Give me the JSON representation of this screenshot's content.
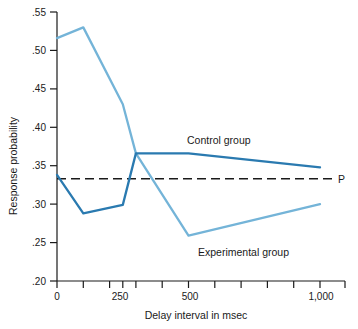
{
  "chart_data": {
    "type": "line",
    "title": "",
    "xlabel": "Delay interval in msec",
    "ylabel": "Response probability",
    "xlim": [
      0,
      1100
    ],
    "ylim": [
      0.2,
      0.55
    ],
    "grid": false,
    "legend_position": "inline-annotation",
    "x_ticks": [
      0,
      100,
      200,
      250,
      300,
      400,
      500,
      600,
      700,
      800,
      900,
      1000,
      1100
    ],
    "x_tick_labels": [
      "0",
      "",
      "",
      "250",
      "",
      "",
      "500",
      "",
      "",
      "",
      "",
      "1,000",
      ""
    ],
    "y_ticks": [
      0.2,
      0.25,
      0.3,
      0.35,
      0.4,
      0.45,
      0.5,
      0.55
    ],
    "y_tick_labels": [
      ".20",
      ".25",
      ".30",
      ".35",
      ".40",
      ".45",
      ".50",
      ".55"
    ],
    "series": [
      {
        "name": "Control group",
        "color": "#2a7ab0",
        "x": [
          0,
          100,
          250,
          300,
          500,
          1000
        ],
        "values": [
          0.338,
          0.288,
          0.299,
          0.366,
          0.366,
          0.348
        ]
      },
      {
        "name": "Experimental group",
        "color": "#74b4d8",
        "x": [
          0,
          100,
          250,
          300,
          500,
          1000
        ],
        "values": [
          0.516,
          0.53,
          0.43,
          0.366,
          0.259,
          0.3
        ]
      }
    ],
    "reference_line": {
      "label": "P",
      "value": 0.333,
      "style": "dashed",
      "color": "#1a1a1a"
    },
    "annotations": [
      {
        "text": "Control group",
        "x": 430,
        "y": 0.392
      },
      {
        "text": "Experimental group",
        "x": 545,
        "y": 0.243
      },
      {
        "text": "P",
        "x": 1090,
        "y": 0.333
      }
    ]
  },
  "axis": {
    "y_title": "Response probability",
    "x_title": "Delay interval in msec"
  }
}
